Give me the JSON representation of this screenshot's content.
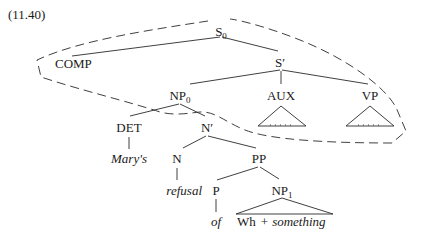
{
  "example_number": "(11.40)",
  "tree": {
    "root": {
      "label": "S",
      "subscript": "0"
    },
    "comp": {
      "label": "COMP"
    },
    "s_bar": {
      "label": "S′"
    },
    "np0": {
      "label": "NP",
      "subscript": "0"
    },
    "aux": {
      "label": "AUX",
      "terminal": ". . ."
    },
    "vp": {
      "label": "VP",
      "terminal": ". . ."
    },
    "det": {
      "label": "DET",
      "word": "Mary's"
    },
    "n_bar": {
      "label": "N′"
    },
    "n": {
      "label": "N",
      "word": "refusal"
    },
    "pp": {
      "label": "PP"
    },
    "p": {
      "label": "P",
      "word": "of"
    },
    "np1": {
      "label": "NP",
      "subscript": "1",
      "word_prefix": "Wh",
      "word_plus": "+",
      "word": "something"
    }
  },
  "annotation": {
    "enclosure": "dashed boundary enclosing S0, COMP, S′, AUX, VP and crossing above N′",
    "colors": {
      "ink": "#1a1a1a",
      "background": "#ffffff"
    }
  }
}
